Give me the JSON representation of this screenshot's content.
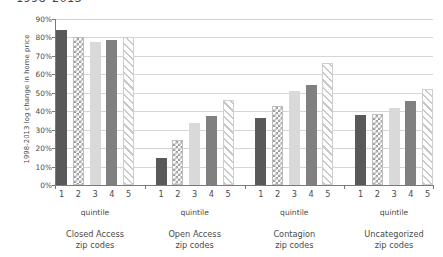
{
  "chart_data": {
    "type": "bar",
    "title": "1998–2013",
    "subtitle": "",
    "xlabel": "quintile",
    "ylabel": "1998-2013 log change in home price",
    "ylim": [
      0,
      90
    ],
    "ytick_values": [
      90,
      80,
      70,
      60,
      50,
      40,
      30,
      20,
      10,
      0
    ],
    "ytick_labels": [
      "90%",
      "80%",
      "70%",
      "60%",
      "50%",
      "40%",
      "30%",
      "20%",
      "10%",
      "0%"
    ],
    "grid": true,
    "legend": "none",
    "categories": [
      "1",
      "2",
      "3",
      "4",
      "5"
    ],
    "groups": [
      {
        "name": "Closed Access",
        "name_line2": "zip codes",
        "axis_label": "quintile",
        "values": [
          84,
          80,
          77.5,
          78.5,
          80
        ]
      },
      {
        "name": "Open Access",
        "name_line2": "zip codes",
        "axis_label": "quintile",
        "values": [
          14.5,
          24.5,
          33.5,
          37.5,
          46
        ]
      },
      {
        "name": "Contagion",
        "name_line2": "zip codes",
        "axis_label": "quintile",
        "values": [
          36.5,
          43,
          51,
          54,
          66
        ]
      },
      {
        "name": "Uncategorized",
        "name_line2": "zip codes",
        "axis_label": "quintile",
        "values": [
          38,
          38.5,
          41.5,
          45.5,
          52
        ]
      }
    ],
    "series_styles": [
      "solid-dark",
      "crosshatch",
      "solid-light",
      "solid-medium",
      "diagonal-hatch"
    ],
    "colors": {
      "quintile_1": "#595959",
      "quintile_2": "#9e9e9e",
      "quintile_3": "#d9d9d9",
      "quintile_4": "#808080",
      "quintile_5": "#c9c9c9",
      "gridline": "#d6d6d6",
      "axis": "#7a7a7a",
      "text": "#4a4a4a",
      "background": "#ffffff"
    }
  }
}
